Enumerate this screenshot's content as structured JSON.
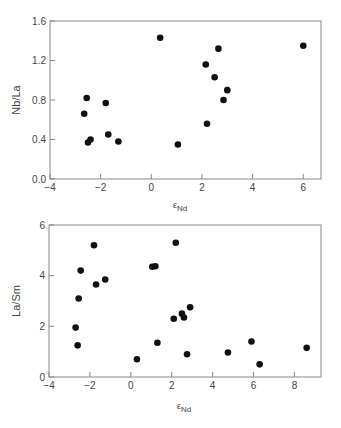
{
  "chart_data": [
    {
      "type": "scatter",
      "title": "",
      "xlabel": "εNd",
      "ylabel": "Nb/La",
      "xlim": [
        -4,
        6.7
      ],
      "ylim": [
        0,
        1.6
      ],
      "xticks": [
        -4,
        -2,
        0,
        2,
        4,
        6
      ],
      "xtick_labels": [
        "−4",
        "−2",
        "0",
        "2",
        "4",
        "6"
      ],
      "yticks": [
        0.0,
        0.4,
        0.8,
        1.2,
        1.6
      ],
      "ytick_labels": [
        "0.0",
        "0.4",
        "0.8",
        "1.2",
        "1.6"
      ],
      "grid": false,
      "legend": null,
      "points": [
        {
          "x": -2.65,
          "y": 0.66
        },
        {
          "x": -2.55,
          "y": 0.82
        },
        {
          "x": -2.5,
          "y": 0.37
        },
        {
          "x": -2.4,
          "y": 0.4
        },
        {
          "x": -1.8,
          "y": 0.77
        },
        {
          "x": -1.7,
          "y": 0.45
        },
        {
          "x": -1.3,
          "y": 0.38
        },
        {
          "x": 0.35,
          "y": 1.43
        },
        {
          "x": 1.05,
          "y": 0.35
        },
        {
          "x": 2.15,
          "y": 1.16
        },
        {
          "x": 2.2,
          "y": 0.56
        },
        {
          "x": 2.5,
          "y": 1.03
        },
        {
          "x": 2.65,
          "y": 1.32
        },
        {
          "x": 2.85,
          "y": 0.8
        },
        {
          "x": 3.0,
          "y": 0.9
        },
        {
          "x": 6.0,
          "y": 1.35
        }
      ]
    },
    {
      "type": "scatter",
      "title": "",
      "xlabel": "εNd",
      "ylabel": "La/Sm",
      "xlim": [
        -4,
        9.3
      ],
      "ylim": [
        0,
        6
      ],
      "xticks": [
        -4,
        -2,
        0,
        2,
        4,
        6,
        8
      ],
      "xtick_labels": [
        "−4",
        "−2",
        "0",
        "2",
        "4",
        "6",
        "8"
      ],
      "yticks": [
        0,
        2,
        4,
        6
      ],
      "ytick_labels": [
        "0",
        "2",
        "4",
        "6"
      ],
      "grid": false,
      "legend": null,
      "points": [
        {
          "x": -2.7,
          "y": 1.95
        },
        {
          "x": -2.6,
          "y": 1.25
        },
        {
          "x": -2.55,
          "y": 3.1
        },
        {
          "x": -2.45,
          "y": 4.2
        },
        {
          "x": -1.8,
          "y": 5.2
        },
        {
          "x": -1.7,
          "y": 3.65
        },
        {
          "x": -1.25,
          "y": 3.85
        },
        {
          "x": 0.3,
          "y": 0.7
        },
        {
          "x": 1.05,
          "y": 4.35
        },
        {
          "x": 1.2,
          "y": 4.37
        },
        {
          "x": 1.3,
          "y": 1.35
        },
        {
          "x": 2.1,
          "y": 2.3
        },
        {
          "x": 2.2,
          "y": 5.3
        },
        {
          "x": 2.5,
          "y": 2.5
        },
        {
          "x": 2.6,
          "y": 2.35
        },
        {
          "x": 2.75,
          "y": 0.9
        },
        {
          "x": 2.9,
          "y": 2.75
        },
        {
          "x": 4.75,
          "y": 0.97
        },
        {
          "x": 5.9,
          "y": 1.4
        },
        {
          "x": 6.3,
          "y": 0.5
        },
        {
          "x": 8.6,
          "y": 1.15
        }
      ]
    }
  ],
  "charts": [
    {
      "xlabel_main": "ε",
      "xlabel_sub": "Nd",
      "ylabel": "Nb/La"
    },
    {
      "xlabel_main": "ε",
      "xlabel_sub": "Nd",
      "ylabel": "La/Sm"
    }
  ],
  "style": {
    "point_color": "#111111",
    "axis_color": "#888888",
    "text_color": "#444444"
  }
}
